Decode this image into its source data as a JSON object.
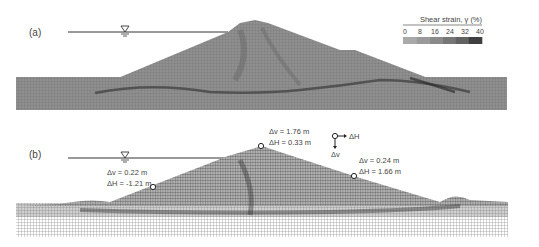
{
  "panels": [
    {
      "label": "(a)",
      "legend": {
        "title": "Shear strain, γ (%)",
        "ticks": [
          "0",
          "8",
          "16",
          "24",
          "32",
          "40"
        ],
        "colors": [
          "#a9a9a9",
          "#9a9a9a",
          "#8a8a8a",
          "#777777",
          "#626262",
          "#3f3f3f"
        ]
      },
      "water_symbol": "water-table-icon"
    },
    {
      "label": "(b)",
      "water_symbol": "water-table-icon",
      "annotations": [
        {
          "id": "left-slope",
          "dv": "Δv = 0.22 m",
          "dh": "ΔH = -1.21 m",
          "dv_val": 0.22,
          "dh_val": -1.21
        },
        {
          "id": "crest",
          "dv": "Δv = 1.76 m",
          "dh": "ΔH = 0.33 m",
          "dv_val": 1.76,
          "dh_val": 0.33
        },
        {
          "id": "right-slope",
          "dv": "Δv = 0.24 m",
          "dh": "ΔH = 1.66 m",
          "dv_val": 0.24,
          "dh_val": 1.66
        }
      ],
      "axis_key": {
        "horizontal": "ΔH",
        "vertical": "Δv"
      }
    }
  ],
  "colors": {
    "mesh_light": "#b3b3b3",
    "mesh_mid": "#8c8c8c",
    "mesh_dark": "#3a3a3a",
    "line": "#333333"
  }
}
